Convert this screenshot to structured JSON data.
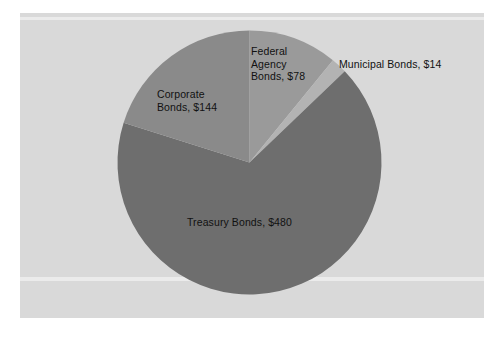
{
  "chart_data": {
    "type": "pie",
    "title": "",
    "subtitle": "",
    "xlabel": "",
    "ylabel": "",
    "legend_position": "none",
    "grid": false,
    "labels_inside": true,
    "total": 716,
    "currency": "$",
    "categories": [
      "Federal Agency Bonds",
      "Municipal Bonds",
      "Treasury Bonds",
      "Corporate Bonds"
    ],
    "values": [
      78,
      14,
      480,
      144
    ],
    "slices": [
      {
        "name": "federal-agency-bonds",
        "category": "Federal Agency Bonds",
        "value": 78,
        "label": "Federal\nAgency\nBonds, $78",
        "color": "#9a9a9a",
        "start_angle_deg": 0.0,
        "end_angle_deg": 39.2,
        "percent": 10.9
      },
      {
        "name": "municipal-bonds",
        "category": "Municipal Bonds",
        "value": 14,
        "label": "Municipal Bonds, $14",
        "color": "#b3b3b3",
        "start_angle_deg": 39.2,
        "end_angle_deg": 46.2,
        "percent": 2.0
      },
      {
        "name": "treasury-bonds",
        "category": "Treasury Bonds",
        "value": 480,
        "label": "Treasury Bonds, $480",
        "color": "#6e6e6e",
        "start_angle_deg": 46.2,
        "end_angle_deg": 287.5,
        "percent": 67.0
      },
      {
        "name": "corporate-bonds",
        "category": "Corporate Bonds",
        "value": 144,
        "label": "Corporate\nBonds, $144",
        "color": "#8a8a8a",
        "start_angle_deg": 287.5,
        "end_angle_deg": 360.0,
        "percent": 20.1
      }
    ],
    "geometry": {
      "center_x": 249.5,
      "center_y": 162.5,
      "radius": 132
    },
    "colors": {
      "plot_background": "#d9d9d9",
      "page_background": "#ffffff",
      "label_text": "#111111"
    }
  }
}
